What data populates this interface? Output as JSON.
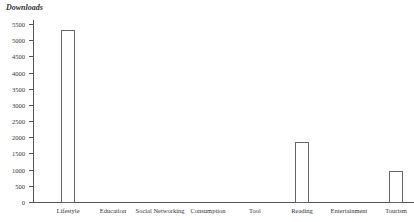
{
  "chart_data": {
    "type": "bar",
    "title": "",
    "xlabel": "",
    "ylabel": "Downloads",
    "categories": [
      "Lifestyle",
      "Education",
      "Social Networking",
      "Consumption",
      "Tool",
      "Reading",
      "Entertainment",
      "Tourism"
    ],
    "values": [
      5300,
      0,
      0,
      0,
      0,
      1840,
      0,
      960
    ],
    "ylim": [
      0,
      5500
    ],
    "yticks": [
      0,
      500,
      1000,
      1500,
      2000,
      2500,
      3000,
      3500,
      4000,
      4500,
      5000,
      5500
    ],
    "grid": false,
    "legend": null
  }
}
